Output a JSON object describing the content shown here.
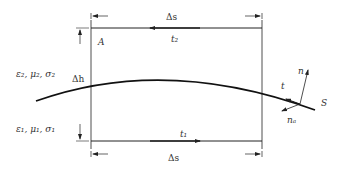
{
  "diagram": {
    "labels": {
      "medium2": "ε₂, μ₂, σ₂",
      "medium1": "ε₁, μ₁, σ₁",
      "delta_h": "Δh",
      "delta_s_top": "Δs",
      "delta_s_bottom": "Δs",
      "point_A": "A",
      "t2": "t₂",
      "t1": "t₁",
      "t": "t",
      "n": "n",
      "nA": "nₐ",
      "S": "S"
    },
    "colors": {
      "stroke": "#222222",
      "text": "#333333"
    }
  }
}
